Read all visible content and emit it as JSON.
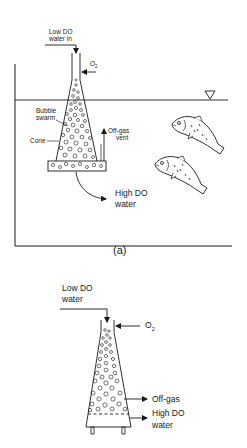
{
  "figure_a": {
    "caption": "(a)",
    "labels": {
      "inlet_line1": "Low DO",
      "inlet_line2": "water in",
      "oxygen_main": "O",
      "oxygen_sub": "2",
      "bubble_line1": "Bubble",
      "bubble_line2": "swarm",
      "cone": "Cone",
      "offgas_line1": "Off-gas",
      "offgas_line2": "vent",
      "outlet_line1": "High DO",
      "outlet_line2": "water"
    },
    "elements": [
      "tank",
      "water-surface",
      "water-level-marker",
      "cone-oxygenator",
      "bubble-swarm",
      "fish",
      "fish"
    ]
  },
  "figure_b": {
    "labels": {
      "inlet_line1": "Low DO",
      "inlet_line2": "water",
      "oxygen_main": "O",
      "oxygen_sub": "2",
      "offgas": "Off-gas",
      "outlet_line1": "High DO",
      "outlet_line2": "water"
    },
    "elements": [
      "cone-oxygenator",
      "bubble-swarm",
      "dashed-level-line",
      "support-legs"
    ]
  },
  "colors": {
    "ink": "#1a1a1a",
    "background": "#ffffff"
  }
}
